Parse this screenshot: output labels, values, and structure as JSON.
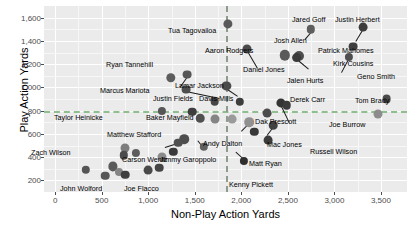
{
  "chart_data": {
    "type": "scatter",
    "title": "",
    "xlabel": "Non-Play Action Yards",
    "ylabel": "Play Action Yards",
    "xlim": [
      -120,
      3780
    ],
    "ylim": [
      100,
      1700
    ],
    "xticks": [
      0,
      500,
      1000,
      1500,
      2000,
      2500,
      3000,
      3500
    ],
    "xticklabels": [
      "0",
      "500",
      "1,000",
      "1,500",
      "2,000",
      "2,500",
      "3,000",
      "3,500"
    ],
    "yticks": [
      200,
      400,
      600,
      800,
      1000,
      1200,
      1400,
      1600
    ],
    "yticklabels": [
      "200",
      "400",
      "600",
      "800",
      "1,000",
      "1,200",
      "1,400",
      "1,600"
    ],
    "grid": true,
    "legend": false,
    "panel_color": "#ebebeb",
    "grid_major_color": "#ffffff",
    "grid_minor_color": "#f7f7f7",
    "reference_lines": [
      {
        "orientation": "horizontal",
        "value": 800,
        "color": "#8fbf8f",
        "style": "dashed"
      },
      {
        "orientation": "vertical",
        "value": 1830,
        "color": "#8f9b8f",
        "style": "dashed"
      }
    ],
    "points": [
      {
        "label": "Tua Tagovailoa",
        "x": 1855,
        "y": 1545,
        "r": 4.6,
        "color": "#595959",
        "lx": 168,
        "ly": 27,
        "anchor": "start"
      },
      {
        "label": "Jared Goff",
        "x": 2745,
        "y": 1500,
        "r": 4.2,
        "color": "#5e5e5e",
        "lx": 292,
        "ly": 16,
        "anchor": "start"
      },
      {
        "label": "Justin Herbert",
        "x": 3310,
        "y": 1520,
        "r": 4.4,
        "color": "#3c3c3c",
        "lx": 335,
        "ly": 16,
        "anchor": "start"
      },
      {
        "label": "Aaron Rodgers",
        "x": 2065,
        "y": 1330,
        "r": 4.5,
        "color": "#4a4a4a",
        "lx": 205,
        "ly": 47,
        "anchor": "start"
      },
      {
        "label": "Josh Allen",
        "x": 2470,
        "y": 1275,
        "r": 5.2,
        "color": "#5a5a5a",
        "lx": 274,
        "ly": 37,
        "anchor": "start"
      },
      {
        "label": "Patrick Mahomes",
        "x": 3200,
        "y": 1350,
        "r": 4.4,
        "color": "#3f3f3f",
        "lx": 318,
        "ly": 47,
        "anchor": "start"
      },
      {
        "label": "Kirk Cousins",
        "x": 2620,
        "y": 1270,
        "r": 5.0,
        "color": "#4d4d4d",
        "lx": 333,
        "ly": 60,
        "anchor": "start"
      },
      {
        "label": "Ryan Tannehill",
        "x": 1420,
        "y": 1110,
        "r": 4.4,
        "color": "#555555",
        "lx": 106,
        "ly": 61,
        "anchor": "start"
      },
      {
        "label": "Geno Smith",
        "x": 3160,
        "y": 1265,
        "r": 4.1,
        "color": "#4f4f4f",
        "lx": 357,
        "ly": 73,
        "anchor": "start"
      },
      {
        "label": "Daniel Jones",
        "x": 1840,
        "y": 1010,
        "r": 4.6,
        "color": "#4b4b4b",
        "lx": 243,
        "ly": 66,
        "anchor": "start"
      },
      {
        "label": "Jalen Hurts",
        "x": 2595,
        "y": 1255,
        "r": 4.9,
        "color": "#3a3a3a",
        "lx": 287,
        "ly": 77,
        "anchor": "start"
      },
      {
        "label": "Marcus Mariota",
        "x": 1245,
        "y": 1085,
        "r": 4.7,
        "color": "#5c5c5c",
        "lx": 100,
        "ly": 87,
        "anchor": "start"
      },
      {
        "label": "Lamar Jackson",
        "x": 1410,
        "y": 980,
        "r": 4.4,
        "color": "#4e4e4e",
        "lx": 175,
        "ly": 82,
        "anchor": "start"
      },
      {
        "label": "Justin Fields",
        "x": 1715,
        "y": 880,
        "r": 4.3,
        "color": "#474747",
        "lx": 153,
        "ly": 95,
        "anchor": "start"
      },
      {
        "label": "Davis Mills",
        "x": 1985,
        "y": 875,
        "r": 4.2,
        "color": "#3d3d3d",
        "lx": 199,
        "ly": 95,
        "anchor": "start"
      },
      {
        "label": "Derek Carr",
        "x": 2430,
        "y": 865,
        "r": 4.6,
        "color": "#343434",
        "lx": 290,
        "ly": 96,
        "anchor": "start"
      },
      {
        "label": "Tom Brady",
        "x": 3560,
        "y": 900,
        "r": 4.4,
        "color": "#4a4a4a",
        "lx": 355,
        "ly": 97,
        "anchor": "start"
      },
      {
        "label": "Taylor Heinicke",
        "x": 1150,
        "y": 800,
        "r": 4.1,
        "color": "#565656",
        "lx": 54,
        "ly": 114,
        "anchor": "start"
      },
      {
        "label": "Baker Mayfield",
        "x": 1470,
        "y": 790,
        "r": 4.3,
        "color": "#3e3e3e",
        "lx": 146,
        "ly": 114,
        "anchor": "start"
      },
      {
        "label": "Dak Prescott",
        "x": 2275,
        "y": 780,
        "r": 4.4,
        "color": "#4c4c4c",
        "lx": 255,
        "ly": 118,
        "anchor": "start"
      },
      {
        "label": "Joe Burrow",
        "x": 3470,
        "y": 775,
        "r": 4.5,
        "color": "#8c8c8c",
        "lx": 329,
        "ly": 121,
        "anchor": "start"
      },
      {
        "label": "Russell Wilson",
        "x": 2490,
        "y": 845,
        "r": 4.3,
        "color": "#3b3b3b",
        "lx": 310,
        "ly": 148,
        "anchor": "start"
      },
      {
        "label": "Matthew Stafford",
        "x": 1385,
        "y": 555,
        "r": 4.8,
        "color": "#4d4d4d",
        "lx": 107,
        "ly": 131,
        "anchor": "start"
      },
      {
        "label": "Andy Dalton",
        "x": 2085,
        "y": 700,
        "r": 4.8,
        "color": "#919191",
        "lx": 203,
        "ly": 140,
        "anchor": "start"
      },
      {
        "label": "Mac Jones",
        "x": 2345,
        "y": 675,
        "r": 4.3,
        "color": "#424242",
        "lx": 267,
        "ly": 141,
        "anchor": "start"
      },
      {
        "label": "Zach Wilson",
        "x": 745,
        "y": 480,
        "r": 4.5,
        "color": "#7d7d7d",
        "lx": 31,
        "ly": 149,
        "anchor": "start"
      },
      {
        "label": "Carson Wentz",
        "x": 1320,
        "y": 525,
        "r": 4.3,
        "color": "#4f4f4f",
        "lx": 122,
        "ly": 156,
        "anchor": "start"
      },
      {
        "label": "Jimmy Garoppolo",
        "x": 1600,
        "y": 490,
        "r": 4.2,
        "color": "#606060",
        "lx": 160,
        "ly": 156,
        "anchor": "start"
      },
      {
        "label": "Matt Ryan",
        "x": 2290,
        "y": 545,
        "r": 4.4,
        "color": "#3c3c3c",
        "lx": 249,
        "ly": 160,
        "anchor": "start"
      },
      {
        "label": "Kenny Pickett",
        "x": 2030,
        "y": 370,
        "r": 4.1,
        "color": "#2f2f2f",
        "lx": 229,
        "ly": 181,
        "anchor": "start"
      },
      {
        "label": "John Wolford",
        "x": 540,
        "y": 240,
        "r": 4.3,
        "color": "#575757",
        "lx": 60,
        "ly": 185,
        "anchor": "start"
      },
      {
        "label": "Joe Flacco",
        "x": 1000,
        "y": 290,
        "r": 4.4,
        "color": "#4a4a4a",
        "lx": 124,
        "ly": 185,
        "anchor": "start"
      },
      {
        "label": "",
        "x": 330,
        "y": 290,
        "r": 4.2,
        "color": "#555555",
        "lx": 0,
        "ly": 0,
        "anchor": "none"
      },
      {
        "label": "",
        "x": 620,
        "y": 320,
        "r": 4.6,
        "color": "#5a5a5a",
        "lx": 0,
        "ly": 0,
        "anchor": "none"
      },
      {
        "label": "",
        "x": 690,
        "y": 270,
        "r": 4.0,
        "color": "#858585",
        "lx": 0,
        "ly": 0,
        "anchor": "none"
      },
      {
        "label": "",
        "x": 750,
        "y": 250,
        "r": 4.3,
        "color": "#3f3f3f",
        "lx": 0,
        "ly": 0,
        "anchor": "none"
      },
      {
        "label": "",
        "x": 735,
        "y": 415,
        "r": 4.2,
        "color": "#4b4b4b",
        "lx": 0,
        "ly": 0,
        "anchor": "none"
      },
      {
        "label": "",
        "x": 870,
        "y": 440,
        "r": 4.1,
        "color": "#5d5d5d",
        "lx": 0,
        "ly": 0,
        "anchor": "none"
      },
      {
        "label": "",
        "x": 1150,
        "y": 400,
        "r": 4.5,
        "color": "#8a8a8a",
        "lx": 0,
        "ly": 0,
        "anchor": "none"
      },
      {
        "label": "",
        "x": 1120,
        "y": 310,
        "r": 4.3,
        "color": "#454545",
        "lx": 0,
        "ly": 0,
        "anchor": "none"
      },
      {
        "label": "",
        "x": 1270,
        "y": 445,
        "r": 4.2,
        "color": "#3a3a3a",
        "lx": 0,
        "ly": 0,
        "anchor": "none"
      },
      {
        "label": "",
        "x": 1560,
        "y": 735,
        "r": 4.3,
        "color": "#505050",
        "lx": 0,
        "ly": 0,
        "anchor": "none"
      },
      {
        "label": "",
        "x": 1720,
        "y": 730,
        "r": 4.5,
        "color": "#858585",
        "lx": 0,
        "ly": 0,
        "anchor": "none"
      },
      {
        "label": "",
        "x": 1900,
        "y": 725,
        "r": 4.4,
        "color": "#9a9a9a",
        "lx": 0,
        "ly": 0,
        "anchor": "none"
      },
      {
        "label": "",
        "x": 2140,
        "y": 620,
        "r": 4.2,
        "color": "#383838",
        "lx": 0,
        "ly": 0,
        "anchor": "none"
      }
    ],
    "leaders": [
      {
        "x1": 1415,
        "y1": 1090,
        "x2": 1340,
        "y2": 1005
      },
      {
        "x1": 2060,
        "y1": 1325,
        "x2": 2170,
        "y2": 1175
      },
      {
        "x1": 2745,
        "y1": 1480,
        "x2": 2680,
        "y2": 1420
      },
      {
        "x1": 3305,
        "y1": 1500,
        "x2": 3230,
        "y2": 1400
      },
      {
        "x1": 2600,
        "y1": 1245,
        "x2": 2720,
        "y2": 1165
      },
      {
        "x1": 3160,
        "y1": 1250,
        "x2": 3080,
        "y2": 1130
      },
      {
        "x1": 1840,
        "y1": 995,
        "x2": 1960,
        "y2": 930
      },
      {
        "x1": 1405,
        "y1": 965,
        "x2": 1760,
        "y2": 905
      },
      {
        "x1": 1380,
        "y1": 540,
        "x2": 1180,
        "y2": 490
      },
      {
        "x1": 2430,
        "y1": 850,
        "x2": 2520,
        "y2": 700
      },
      {
        "x1": 2085,
        "y1": 690,
        "x2": 2000,
        "y2": 620
      },
      {
        "x1": 2340,
        "y1": 660,
        "x2": 2275,
        "y2": 590
      },
      {
        "x1": 2030,
        "y1": 385,
        "x2": 1940,
        "y2": 450
      },
      {
        "x1": 1600,
        "y1": 480,
        "x2": 1530,
        "y2": 550
      }
    ]
  }
}
